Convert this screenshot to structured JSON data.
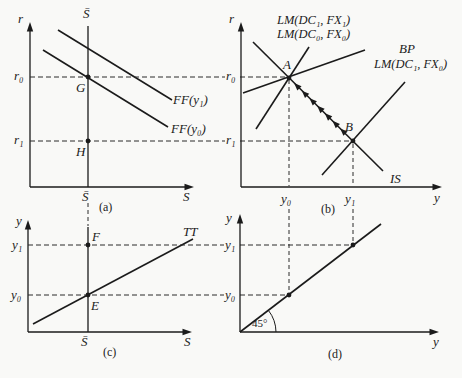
{
  "colors": {
    "ink": "#1b1b1b",
    "background": "#f9f9f7"
  },
  "panel_a": {
    "tag": "(a)",
    "v_axis_label": "r",
    "h_axis_label": "S",
    "sbar_top": "S̄",
    "sbar_axis": "S̄",
    "r0": "r₀",
    "r1": "r₁",
    "point_g": "G",
    "point_h": "H",
    "ff_y1": "FF(y₁)",
    "ff_y0": "FF(y₀)"
  },
  "panel_b": {
    "tag": "(b)",
    "v_axis_label": "r",
    "h_axis_label": "y",
    "lm_dc1_fx1": "LM(DC₁, FX₁)",
    "lm_dc0_fx0": "LM(DC₀, FX₀)",
    "lm_dc1_fx0": "LM(DC₁, FX₀)",
    "bp": "BP",
    "is": "IS",
    "point_a": "A",
    "point_b": "B",
    "r0": "r₀",
    "r1": "r₁",
    "y0": "y₀",
    "y1": "y₁"
  },
  "panel_c": {
    "tag": "(c)",
    "v_axis_label": "y",
    "h_axis_label": "S",
    "tt": "TT",
    "y1": "y₁",
    "y0": "y₀",
    "point_f": "F",
    "point_e": "E",
    "sbar_axis": "S̄"
  },
  "panel_d": {
    "tag": "(d)",
    "v_axis_label": "y",
    "h_axis_label": "y",
    "y1": "y₁",
    "y0": "y₀",
    "angle": "45°"
  }
}
